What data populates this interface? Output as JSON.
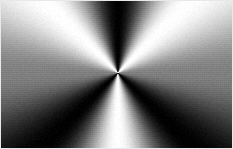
{
  "figure": {
    "width_px": 233,
    "height_px": 149,
    "background_color": "#ffffff",
    "border_color": "#e8e8e8"
  },
  "chart_data": {
    "type": "heatmap",
    "title": "",
    "subtitle": "",
    "xlabel": "",
    "ylabel": "",
    "grid": false,
    "legend": "none",
    "colormap": "gray",
    "colormap_low": "#000000",
    "colormap_high": "#ffffff",
    "field": "angular conic sweep; luminance = 0.5 + 0.5*sin(3*theta)",
    "center": {
      "x_px": 118,
      "y_px": 73,
      "x_frac": 0.506,
      "y_frac": 0.49
    },
    "xlim": [
      0,
      233
    ],
    "ylim": [
      0,
      149
    ],
    "cycles_per_revolution": 3,
    "angle_offset_deg": 0,
    "stops": [
      {
        "angle_deg": 0,
        "value": 0.5,
        "hex": "#808080",
        "note": "right edge, mid gray"
      },
      {
        "angle_deg": 45,
        "value": 1.0,
        "hex": "#ffffff",
        "note": "bright ray upper-right"
      },
      {
        "angle_deg": 90,
        "value": 0.0,
        "hex": "#000000",
        "note": "dark ray straight up"
      },
      {
        "angle_deg": 135,
        "value": 1.0,
        "hex": "#ffffff",
        "note": "bright ray upper-left"
      },
      {
        "angle_deg": 180,
        "value": 0.5,
        "hex": "#808080",
        "note": "left edge, mid gray"
      },
      {
        "angle_deg": 225,
        "value": 0.0,
        "hex": "#000000",
        "note": "dark ray lower-left"
      },
      {
        "angle_deg": 270,
        "value": 1.0,
        "hex": "#ffffff",
        "note": "bright ray straight down"
      },
      {
        "angle_deg": 315,
        "value": 0.0,
        "hex": "#000000",
        "note": "dark ray lower-right"
      },
      {
        "angle_deg": 360,
        "value": 0.5,
        "hex": "#808080",
        "note": "wrap to right edge"
      }
    ],
    "corner_samples": [
      {
        "corner": "top-left",
        "hex": "#fcfcfc",
        "value": 0.99
      },
      {
        "corner": "top-right",
        "hex": "#fafafa",
        "value": 0.98
      },
      {
        "corner": "bottom-left",
        "hex": "#0a0a0a",
        "value": 0.04
      },
      {
        "corner": "bottom-right",
        "hex": "#060606",
        "value": 0.02
      }
    ],
    "edge_samples": [
      {
        "edge": "left-mid",
        "hex": "#7d7d7d",
        "value": 0.49
      },
      {
        "edge": "right-mid",
        "hex": "#6f6f6f",
        "value": 0.44
      },
      {
        "edge": "top-mid",
        "hex": "#0d0d0d",
        "value": 0.05
      },
      {
        "edge": "bottom-mid",
        "hex": "#f2f2f2",
        "value": 0.95
      }
    ]
  }
}
